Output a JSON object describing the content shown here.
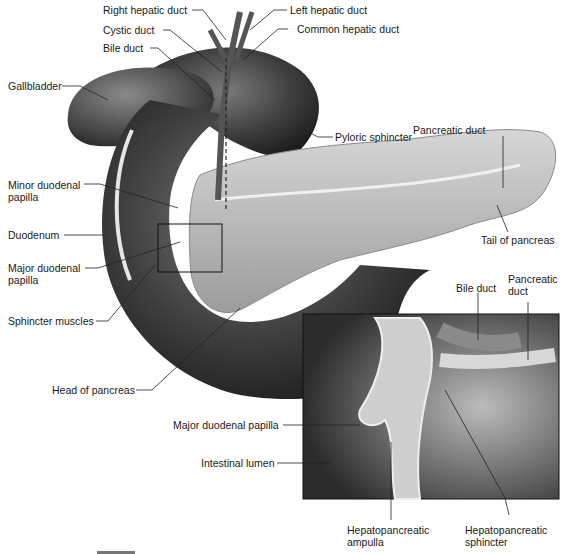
{
  "figure": {
    "labels": {
      "right_hepatic_duct": "Right hepatic duct",
      "left_hepatic_duct": "Left hepatic duct",
      "cystic_duct": "Cystic duct",
      "common_hepatic_duct": "Common hepatic duct",
      "bile_duct": "Bile duct",
      "gallbladder": "Gallbladder",
      "pancreatic_duct": "Pancreatic duct",
      "pyloric_sphincter": "Pyloric sphincter",
      "minor_duodenal_papilla_1": "Minor duodenal",
      "minor_duodenal_papilla_2": "papilla",
      "duodenum": "Duodenum",
      "tail_of_pancreas": "Tail of pancreas",
      "major_duodenal_papilla_1": "Major duodenal",
      "major_duodenal_papilla_2": "papilla",
      "sphincter_muscles": "Sphincter muscles",
      "head_of_pancreas": "Head of pancreas"
    },
    "inset": {
      "labels": {
        "bile_duct": "Bile duct",
        "pancreatic_duct_1": "Pancreatic",
        "pancreatic_duct_2": "duct",
        "major_duodenal_papilla": "Major duodenal papilla",
        "intestinal_lumen": "Intestinal lumen",
        "hepatopancreatic_ampulla_1": "Hepatopancreatic",
        "hepatopancreatic_ampulla_2": "ampulla",
        "hepatopancreatic_sphincter_1": "Hepatopancreatic",
        "hepatopancreatic_sphincter_2": "sphincter"
      }
    },
    "colors": {
      "organ_dark": "#3a3a3a",
      "organ_mid": "#6b6b6b",
      "pancreas": "#bdbdbd",
      "leader_line": "#222222",
      "background": "#ffffff"
    }
  }
}
